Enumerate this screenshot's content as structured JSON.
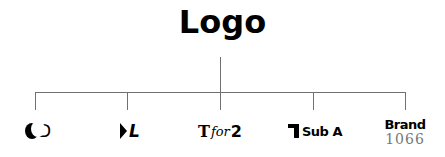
{
  "diagram": {
    "root": {
      "label": "Logo"
    },
    "children": [
      {
        "id": "child-1",
        "icon": "crescent-moon-icon",
        "label": "D"
      },
      {
        "id": "child-2",
        "icon": "play-triangle-icon",
        "label": "L"
      },
      {
        "id": "child-3",
        "prefix": "T",
        "middle": "for",
        "suffix": "2"
      },
      {
        "id": "child-4",
        "icon": "flag-bracket-icon",
        "label": "Sub A"
      },
      {
        "id": "child-5",
        "label": "Brand",
        "sublabel": "1066"
      }
    ],
    "colors": {
      "connector": "#707070",
      "text": "#000000",
      "sublabel": "#777777"
    }
  }
}
